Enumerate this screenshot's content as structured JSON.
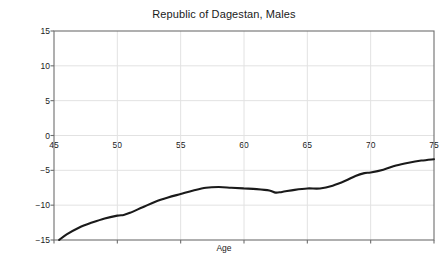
{
  "chart_data": {
    "type": "line",
    "title": "Republic of Dagestan, Males",
    "xlabel": "Age",
    "ylabel": "Age Difference",
    "xlim": [
      45,
      75
    ],
    "ylim": [
      -15,
      15
    ],
    "xticks": [
      45,
      50,
      55,
      60,
      65,
      70,
      75
    ],
    "yticks": [
      15,
      10,
      5,
      0,
      -5,
      -10,
      -15
    ],
    "grid": true,
    "legend": null,
    "series": [
      {
        "name": "Age Difference",
        "color": "#1a1a1a",
        "x": [
          45.4,
          46,
          47,
          48,
          49,
          50,
          50.5,
          51,
          52,
          53,
          54,
          55,
          56,
          57,
          58,
          59,
          60,
          61,
          62,
          62.5,
          63,
          64,
          65,
          66,
          67,
          68,
          68.8,
          69.5,
          70,
          71,
          72,
          73,
          74,
          75
        ],
        "y": [
          -15.0,
          -14.2,
          -13.2,
          -12.5,
          -11.9,
          -11.5,
          -11.4,
          -11.1,
          -10.3,
          -9.5,
          -8.9,
          -8.4,
          -7.9,
          -7.5,
          -7.4,
          -7.5,
          -7.6,
          -7.7,
          -7.9,
          -8.2,
          -8.1,
          -7.8,
          -7.6,
          -7.6,
          -7.2,
          -6.5,
          -5.8,
          -5.4,
          -5.3,
          -4.9,
          -4.3,
          -3.9,
          -3.6,
          -3.4
        ]
      }
    ]
  },
  "axis": {
    "xtick_labels": [
      "45",
      "50",
      "55",
      "60",
      "65",
      "70",
      "75"
    ],
    "ytick_labels": [
      "15",
      "10",
      "5",
      "0",
      "−5",
      "−10",
      "−15"
    ]
  },
  "colors": {
    "line": "#1a1a1a",
    "grid": "#e2e2e2",
    "axis": "#6e6e6e",
    "background": "#ffffff",
    "text": "#1a1a1a"
  }
}
